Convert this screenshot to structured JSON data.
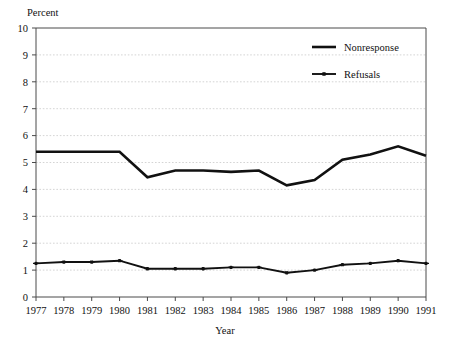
{
  "chart_data": {
    "type": "line",
    "title": "",
    "ylabel": "Percent",
    "xlabel": "Year",
    "x": [
      1977,
      1978,
      1979,
      1980,
      1981,
      1982,
      1983,
      1984,
      1985,
      1986,
      1987,
      1988,
      1989,
      1990,
      1991
    ],
    "categories": [
      "1977",
      "1978",
      "1979",
      "1980",
      "1981",
      "1982",
      "1983",
      "1984",
      "1985",
      "1986",
      "1987",
      "1988",
      "1989",
      "1990",
      "1991"
    ],
    "series": [
      {
        "name": "Nonresponse",
        "marker": "none",
        "values": [
          5.4,
          5.4,
          5.4,
          5.4,
          4.45,
          4.7,
          4.7,
          4.65,
          4.7,
          4.15,
          4.35,
          5.1,
          5.3,
          5.6,
          5.25
        ]
      },
      {
        "name": "Refusals",
        "marker": "star",
        "values": [
          1.25,
          1.3,
          1.3,
          1.35,
          1.05,
          1.05,
          1.05,
          1.1,
          1.1,
          0.9,
          1.0,
          1.2,
          1.25,
          1.35,
          1.25
        ]
      }
    ],
    "ylim": [
      0,
      10
    ],
    "yticks": [
      0,
      1,
      2,
      3,
      4,
      5,
      6,
      7,
      8,
      9,
      10
    ],
    "ytick_labels": [
      "0",
      "1",
      "2",
      "3",
      "4",
      "5",
      "6",
      "7",
      "8",
      "9",
      "10"
    ],
    "grid": true,
    "grid_axis": "y",
    "legend_position": "top-right",
    "legend_entries": [
      "Nonresponse",
      "Refusals"
    ],
    "colors": {
      "series": "#111111",
      "grid": "#c9c9c9",
      "frame": "#4a4a4a",
      "background": "#ffffff"
    }
  },
  "labels": {
    "y_axis_title": "Percent",
    "x_axis_title": "Year"
  },
  "legend": {
    "nonresponse": "Nonresponse",
    "refusals": "Refusals"
  }
}
